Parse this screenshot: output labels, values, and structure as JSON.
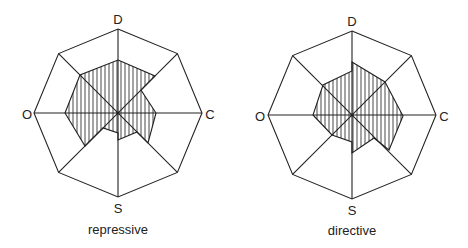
{
  "colors": {
    "line": "#222222",
    "hatch": "#333333",
    "background": "#ffffff"
  },
  "axes": [
    "D",
    "C",
    "S",
    "O"
  ],
  "figures": [
    {
      "caption": "repressive",
      "labels": {
        "D": "D",
        "C": "C",
        "S": "S",
        "O": "O"
      },
      "center": [
        118,
        113
      ],
      "outer_radius": 84,
      "hatched_polygon": [
        [
          118,
          60
        ],
        [
          155,
          76
        ],
        [
          141,
          90
        ],
        [
          156,
          113
        ],
        [
          152,
          128
        ],
        [
          148,
          143
        ],
        [
          137,
          132
        ],
        [
          118,
          140
        ],
        [
          118,
          133
        ],
        [
          103,
          128
        ],
        [
          85,
          146
        ],
        [
          65,
          113
        ],
        [
          80,
          75
        ]
      ]
    },
    {
      "caption": "directive",
      "labels": {
        "D": "D",
        "C": "C",
        "S": "S",
        "O": "O"
      },
      "center": [
        352,
        115
      ],
      "outer_radius": 84,
      "hatched_polygon": [
        [
          352,
          62
        ],
        [
          385,
          82
        ],
        [
          403,
          116
        ],
        [
          389,
          150
        ],
        [
          374,
          138
        ],
        [
          352,
          153
        ],
        [
          352,
          142
        ],
        [
          332,
          135
        ],
        [
          313,
          115
        ],
        [
          323,
          85
        ],
        [
          352,
          71
        ]
      ]
    }
  ]
}
